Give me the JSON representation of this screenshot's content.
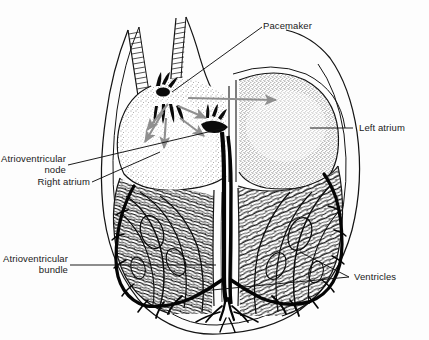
{
  "figure": {
    "background_color": "#fdfdfd",
    "ink_color": "#111111",
    "arrow_color": "#8a8a8a",
    "width": 429,
    "height": 340
  },
  "labels": {
    "pacemaker": "Pacemaker",
    "left_atrium": "Left atrium",
    "atrioventricular_node_line1": "Atrioventricular",
    "atrioventricular_node_line2": "node",
    "right_atrium": "Right atrium",
    "atrioventricular_bundle_line1": "Atrioventricular",
    "atrioventricular_bundle_line2": "bundle",
    "ventricles": "Ventricles"
  },
  "structures": {
    "vena_cava": "superior-vena-cava",
    "sa_node": "sinoatrial-node",
    "av_node": "atrioventricular-node",
    "bundle_of_his": "bundle-of-his",
    "purkinje_fibers": "purkinje-fibers",
    "interventricular_septum": "interventricular-septum",
    "pericardium": "pericardium-outline",
    "right_atrium_chamber": "right-atrium-chamber",
    "left_atrium_chamber": "left-atrium-chamber",
    "right_ventricle_chamber": "right-ventricle-chamber",
    "left_ventricle_chamber": "left-ventricle-chamber"
  },
  "conduction_arrows": {
    "count": 6,
    "description": "gray arrows radiating from the sinoatrial node across the right atrium and into the left atrium"
  }
}
